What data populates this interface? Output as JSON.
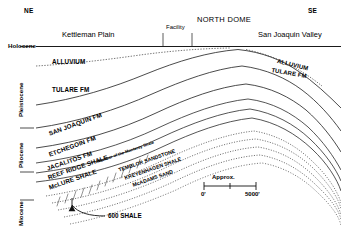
{
  "figure": {
    "orientation": {
      "left": "NE",
      "right": "SE"
    },
    "surface_features": [
      {
        "name": "Kettleman Plain",
        "label": "Kettleman Plain"
      },
      {
        "name": "Facility",
        "label": "Facility"
      },
      {
        "name": "North Dome",
        "label": "NORTH DOME"
      },
      {
        "name": "San Joaquin Valley",
        "label": "San Joaquin Valley"
      }
    ],
    "epochs": [
      {
        "label": "Holocene",
        "orientation": "horizontal"
      },
      {
        "label": "Pleistocene",
        "orientation": "vertical"
      },
      {
        "label": "Pliocene",
        "orientation": "vertical"
      },
      {
        "label": "Miocene",
        "orientation": "vertical"
      }
    ],
    "formations_left": [
      {
        "label": "ALLUVIUM"
      },
      {
        "label": "TULARE FM"
      },
      {
        "label": "SAN JOAQUIN FM"
      },
      {
        "label": "ETCHEGOIN FM"
      },
      {
        "label": "JACALITOS FM"
      },
      {
        "label": "REEF RIDGE SHALE"
      },
      {
        "label": "McLURE SHALE"
      }
    ],
    "formations_right": [
      {
        "label": "ALLUVIUM"
      },
      {
        "label": "TULARE FM"
      }
    ],
    "monterey_members": {
      "note": "Member of the Monterey Shale",
      "items": [
        {
          "label": "TEMBLOR SANDSTONE"
        },
        {
          "label": "KREYENHAGEN SHALE"
        },
        {
          "label": "McADAMS SAND"
        }
      ]
    },
    "callout": {
      "label": "600 SHALE"
    },
    "scale": {
      "title": "Approx.",
      "min": "0'",
      "max": "5000'"
    },
    "colors": {
      "ink": "#000000",
      "background": "#ffffff",
      "line": "#333333"
    }
  }
}
